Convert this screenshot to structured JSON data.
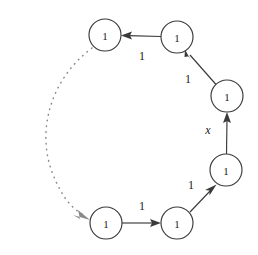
{
  "figure": {
    "kind": "directed-weighted-cycle-graph",
    "background_color": "#ffffff",
    "stroke_color": "#3a3a3a",
    "dotted_stroke_color": "#8a8a8a",
    "text_color": "#202020",
    "width": 258,
    "height": 255
  },
  "nodes": [
    {
      "id": "n1",
      "label": "1",
      "cx": 105,
      "cy": 35,
      "r": 16
    },
    {
      "id": "n2",
      "label": "1",
      "cx": 177,
      "cy": 37,
      "r": 16
    },
    {
      "id": "n3",
      "label": "1",
      "cx": 227,
      "cy": 96,
      "r": 16
    },
    {
      "id": "n4",
      "label": "1",
      "cx": 226,
      "cy": 170,
      "r": 16
    },
    {
      "id": "n5",
      "label": "1",
      "cx": 177,
      "cy": 223,
      "r": 16
    },
    {
      "id": "n6",
      "label": "1",
      "cx": 106,
      "cy": 223,
      "r": 16
    }
  ],
  "edges": [
    {
      "id": "e_n2_n1",
      "from": "n2",
      "to": "n1",
      "label": "1",
      "label_x": 142,
      "label_y": 56,
      "style": "solid",
      "arrow": true
    },
    {
      "id": "e_n3_n2",
      "from": "n3",
      "to": "n2",
      "label": "1",
      "label_x": 188,
      "label_y": 79,
      "style": "solid",
      "arrow": true
    },
    {
      "id": "e_n4_n3",
      "from": "n4",
      "to": "n3",
      "label": "x",
      "label_x": 208,
      "label_y": 130,
      "style": "solid",
      "arrow": true,
      "label_italic": true
    },
    {
      "id": "e_n5_n4",
      "from": "n5",
      "to": "n4",
      "label": "1",
      "label_x": 191,
      "label_y": 185,
      "style": "solid",
      "arrow": true
    },
    {
      "id": "e_n6_n5",
      "from": "n6",
      "to": "n5",
      "label": "1",
      "label_x": 142,
      "label_y": 206,
      "style": "solid",
      "arrow": true
    },
    {
      "id": "e_n1_n6",
      "from": "n1",
      "to": "n6",
      "label": "",
      "style": "dotted",
      "arrow": true
    }
  ]
}
